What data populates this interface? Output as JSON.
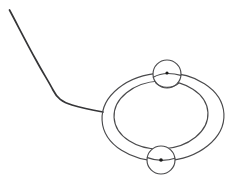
{
  "image": {
    "title": "Line drawing of a ring with cord and two beads",
    "background_color": "#ffffff",
    "width": 234,
    "height": 182,
    "stroke_color": "#4a4a4c",
    "cord_color": "#353537",
    "dot_color": "#1a1a1a"
  },
  "objects": {
    "outer_ellipse": {
      "name": "outer-ring-ellipse",
      "cx": 163,
      "cy": 117,
      "rx": 61,
      "ry": 44,
      "rotation": -3
    },
    "inner_ellipse": {
      "name": "inner-ring-ellipse",
      "cx": 161,
      "cy": 115,
      "rx": 47,
      "ry": 34,
      "rotation": -3
    },
    "top_bead": {
      "name": "top-bead",
      "cx": 167,
      "cy": 74,
      "r": 14,
      "dot_r": 1.6,
      "dot_cx": 167,
      "dot_cy": 73
    },
    "bottom_bead": {
      "name": "bottom-bead",
      "cx": 161,
      "cy": 160,
      "r": 14,
      "dot_r": 1.8,
      "dot_cx": 161,
      "dot_cy": 160
    },
    "cord": {
      "name": "cord-line",
      "path": "M 9.5 10 C 16 22, 26 42, 36 60 C 43 73, 49 82, 53 90 C 57 98, 62 102, 72 105 C 82 108, 92 110, 103 112"
    }
  },
  "labels": {
    "alt_text": "A simple black-and-white line drawing showing an oval ring shape with a wavy cord extending from its left side and two small circles, each with a center dot, located at the top and bottom of the ring."
  }
}
